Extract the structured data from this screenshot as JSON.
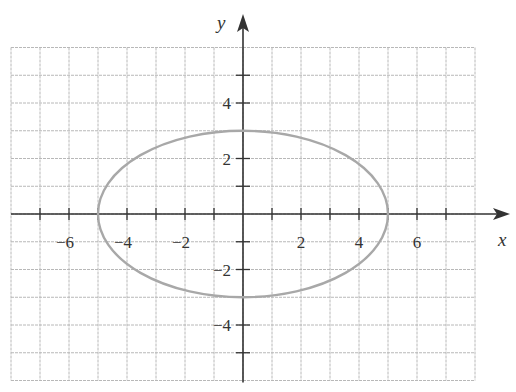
{
  "chart_data": {
    "type": "line",
    "title": "",
    "xlabel": "x",
    "ylabel": "y",
    "xlim": [
      -8,
      8
    ],
    "ylim": [
      -6,
      6
    ],
    "grid": true,
    "legend": null,
    "x_ticks": [
      -6,
      -4,
      -2,
      2,
      4,
      6
    ],
    "y_ticks": [
      -4,
      -2,
      2,
      4
    ],
    "x_tick_labels": [
      "−6",
      "−4",
      "−2",
      "2",
      "4",
      "6"
    ],
    "y_tick_labels": [
      "−4",
      "−2",
      "2",
      "4"
    ],
    "series": [
      {
        "name": "ellipse",
        "equation": "x^2/25 + y^2/9 = 1",
        "shape": "ellipse",
        "center": [
          0,
          0
        ],
        "semi_major_x": 5,
        "semi_minor_y": 3,
        "vertices": [
          [
            -5,
            0
          ],
          [
            5,
            0
          ],
          [
            0,
            3
          ],
          [
            0,
            -3
          ]
        ],
        "color": "#a8a8a8"
      }
    ]
  },
  "colors": {
    "grid": "#b8b8b8",
    "axis": "#333333",
    "curve": "#a8a8a8"
  }
}
